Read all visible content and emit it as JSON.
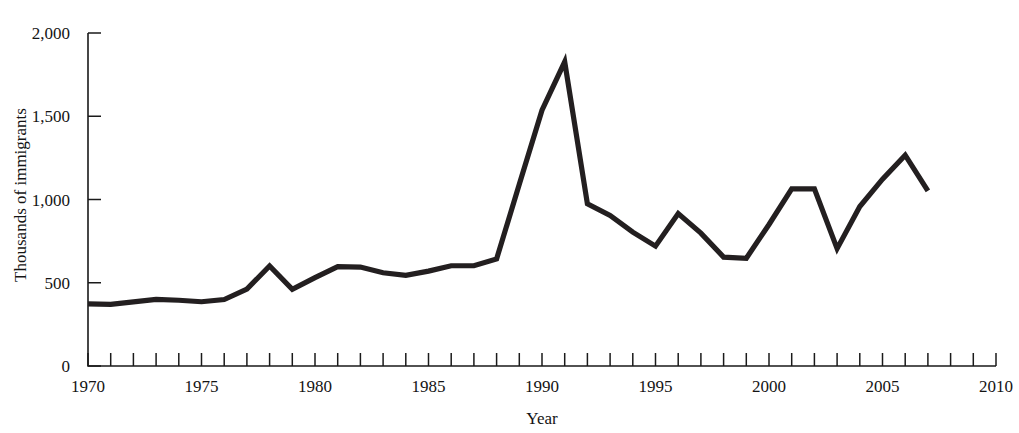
{
  "figure": {
    "cut_off_title": "",
    "line_color": "#231f20",
    "axis_color": "#1a1a1a",
    "background": "#ffffff"
  },
  "chart_data": {
    "type": "line",
    "title": "",
    "xlabel": "Year",
    "ylabel": "Thousands of immigrants",
    "xlim": [
      1970,
      2010
    ],
    "ylim": [
      0,
      2000
    ],
    "grid": false,
    "legend": null,
    "y_ticks": [
      0,
      500,
      1000,
      1500,
      2000
    ],
    "y_tick_labels": [
      "0",
      "500",
      "1,000",
      "1,500",
      "2,000"
    ],
    "x_ticks": [
      1970,
      1975,
      1980,
      1985,
      1990,
      1995,
      2000,
      2005,
      2010
    ],
    "x_tick_labels": [
      "1970",
      "1975",
      "1980",
      "1985",
      "1990",
      "1995",
      "2000",
      "2005",
      "2010"
    ],
    "x_minor_tick_interval": 1,
    "x": [
      1970,
      1971,
      1972,
      1973,
      1974,
      1975,
      1976,
      1977,
      1978,
      1979,
      1980,
      1981,
      1982,
      1983,
      1984,
      1985,
      1986,
      1987,
      1988,
      1989,
      1990,
      1991,
      1992,
      1993,
      1994,
      1995,
      1996,
      1997,
      1998,
      1999,
      2000,
      2001,
      2002,
      2003,
      2004,
      2005,
      2006,
      2007
    ],
    "values": [
      373,
      370,
      385,
      400,
      395,
      386,
      399,
      462,
      601,
      460,
      531,
      597,
      594,
      560,
      544,
      570,
      602,
      602,
      643,
      1091,
      1536,
      1827,
      974,
      904,
      804,
      720,
      916,
      798,
      654,
      647,
      850,
      1064,
      1064,
      705,
      958,
      1122,
      1266,
      1052
    ],
    "series": [
      {
        "name": "Thousands of immigrants",
        "values": [
          373,
          370,
          385,
          400,
          395,
          386,
          399,
          462,
          601,
          460,
          531,
          597,
          594,
          560,
          544,
          570,
          602,
          602,
          643,
          1091,
          1536,
          1827,
          974,
          904,
          804,
          720,
          916,
          798,
          654,
          647,
          850,
          1064,
          1064,
          705,
          958,
          1122,
          1266,
          1052
        ]
      }
    ],
    "annotations": [
      {
        "label": "peak",
        "x": 1991,
        "y": 1827
      },
      {
        "label": "local-spike",
        "x": 1978,
        "y": 601
      },
      {
        "label": "trough",
        "x": 2003,
        "y": 705
      }
    ]
  }
}
